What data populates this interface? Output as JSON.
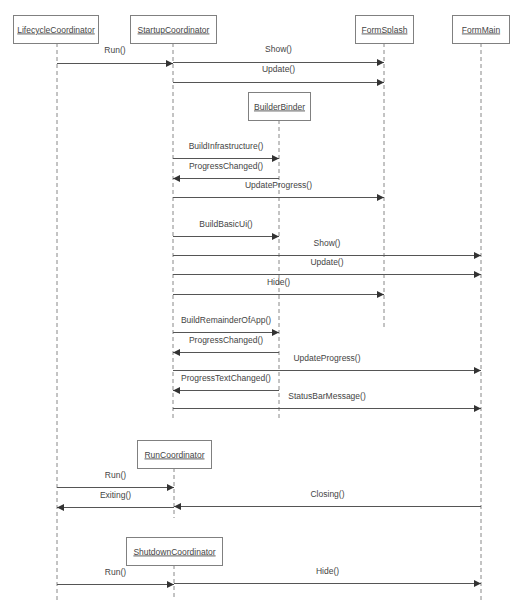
{
  "diagram": {
    "type": "sequence",
    "participants": [
      {
        "id": "lifecycle",
        "label": "LifecycleCoordinator",
        "x": 13,
        "y": 15,
        "w": 85,
        "h": 28,
        "lifeline_x": 57,
        "lifeline_end": 600
      },
      {
        "id": "startup",
        "label": "StartupCoordinator",
        "x": 130,
        "y": 15,
        "w": 86,
        "h": 28,
        "lifeline_x": 173,
        "lifeline_end": 420
      },
      {
        "id": "formsplash",
        "label": "FormSplash",
        "x": 355,
        "y": 15,
        "w": 58,
        "h": 28,
        "lifeline_x": 384,
        "lifeline_end": 330
      },
      {
        "id": "formmain",
        "label": "FormMain",
        "x": 452,
        "y": 15,
        "w": 57,
        "h": 28,
        "lifeline_x": 481,
        "lifeline_end": 600
      },
      {
        "id": "builderbinder",
        "label": "BuilderBinder",
        "x": 248,
        "y": 92,
        "w": 62,
        "h": 28,
        "lifeline_x": 279,
        "lifeline_end": 420
      },
      {
        "id": "runcoord",
        "label": "RunCoordinator",
        "x": 137,
        "y": 440,
        "w": 74,
        "h": 28,
        "lifeline_x": 174,
        "lifeline_end": 518
      },
      {
        "id": "shutdowncoord",
        "label": "ShutdownCoordinator",
        "x": 126,
        "y": 537,
        "w": 96,
        "h": 28,
        "lifeline_x": 174,
        "lifeline_end": 600
      }
    ],
    "messages": [
      {
        "label": "Run()",
        "from_x": 57,
        "to_x": 173,
        "y": 63,
        "label_y": 53
      },
      {
        "label": "Show()",
        "from_x": 173,
        "to_x": 384,
        "y": 62,
        "label_y": 52
      },
      {
        "label": "Update()",
        "from_x": 173,
        "to_x": 384,
        "y": 82,
        "label_y": 72
      },
      {
        "label": "BuildInfrastructure()",
        "from_x": 173,
        "to_x": 279,
        "y": 158,
        "label_y": 149
      },
      {
        "label": "ProgressChanged()",
        "from_x": 279,
        "to_x": 173,
        "y": 178,
        "label_y": 169
      },
      {
        "label": "UpdateProgress()",
        "from_x": 173,
        "to_x": 384,
        "y": 197,
        "label_y": 188
      },
      {
        "label": "BuildBasicUi()",
        "from_x": 173,
        "to_x": 279,
        "y": 236,
        "label_y": 227
      },
      {
        "label": "Show()",
        "from_x": 173,
        "to_x": 481,
        "y": 255,
        "label_y": 246
      },
      {
        "label": "Update()",
        "from_x": 173,
        "to_x": 481,
        "y": 274,
        "label_y": 265
      },
      {
        "label": "Hide()",
        "from_x": 173,
        "to_x": 384,
        "y": 294,
        "label_y": 285
      },
      {
        "label": "BuildRemainderOfApp()",
        "from_x": 173,
        "to_x": 279,
        "y": 332,
        "label_y": 323
      },
      {
        "label": "ProgressChanged()",
        "from_x": 279,
        "to_x": 173,
        "y": 352,
        "label_y": 343
      },
      {
        "label": "UpdateProgress()",
        "from_x": 173,
        "to_x": 481,
        "y": 370,
        "label_y": 361
      },
      {
        "label": "ProgressTextChanged()",
        "from_x": 279,
        "to_x": 173,
        "y": 390,
        "label_y": 381
      },
      {
        "label": "StatusBarMessage()",
        "from_x": 173,
        "to_x": 481,
        "y": 408,
        "label_y": 399
      },
      {
        "label": "Run()",
        "from_x": 57,
        "to_x": 174,
        "y": 487,
        "label_y": 478
      },
      {
        "label": "Exiting()",
        "from_x": 174,
        "to_x": 57,
        "y": 507,
        "label_y": 498
      },
      {
        "label": "Closing()",
        "from_x": 481,
        "to_x": 174,
        "y": 506,
        "label_y": 497
      },
      {
        "label": "Run()",
        "from_x": 57,
        "to_x": 174,
        "y": 584,
        "label_y": 575
      },
      {
        "label": "Hide()",
        "from_x": 174,
        "to_x": 481,
        "y": 583,
        "label_y": 574
      }
    ]
  }
}
